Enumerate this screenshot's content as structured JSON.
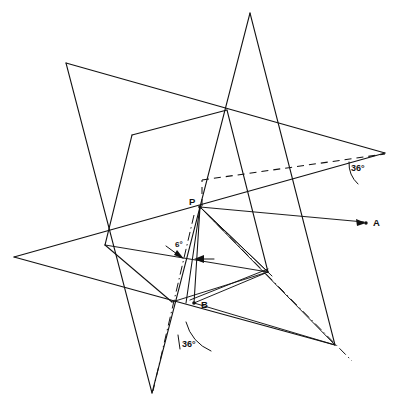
{
  "figure": {
    "width": 400,
    "height": 411,
    "background_color": "#ffffff",
    "line_color": "#111111"
  },
  "points": [
    {
      "id": "P",
      "label": "P",
      "x": 200,
      "y": 207,
      "label_x": 189,
      "label_y": 205
    },
    {
      "id": "A",
      "label": "A",
      "x": 366,
      "y": 223,
      "label_x": 373,
      "label_y": 226
    },
    {
      "id": "B",
      "label": "B",
      "x": 194,
      "y": 303,
      "label_x": 201,
      "label_y": 308
    }
  ],
  "angles": [
    {
      "id": "angle-right",
      "label": "36°",
      "value": 36,
      "unit": "degrees",
      "label_x": 351,
      "label_y": 171
    },
    {
      "id": "angle-bottom",
      "label": "36°",
      "value": 36,
      "unit": "degrees",
      "label_x": 180,
      "label_y": 345
    },
    {
      "id": "angle-wedge",
      "label": "6°",
      "value": 6,
      "unit": "degrees",
      "label_x": 175,
      "label_y": 247
    }
  ],
  "star": {
    "name": "outer-pentagram",
    "tips": [
      {
        "name": "tip-top",
        "x": 250,
        "y": 13
      },
      {
        "name": "tip-right",
        "x": 385,
        "y": 153
      },
      {
        "name": "tip-bottom-right",
        "x": 335,
        "y": 345
      },
      {
        "name": "tip-bottom-left",
        "x": 152,
        "y": 393
      },
      {
        "name": "tip-left",
        "x": 14,
        "y": 257
      },
      {
        "name": "tip-upper-left",
        "x": 66,
        "y": 63
      }
    ]
  },
  "legend": {
    "line_styles": [
      {
        "name": "solid",
        "meaning": "construction line"
      },
      {
        "name": "dashed",
        "meaning": "reference line"
      },
      {
        "name": "dash-dot",
        "meaning": "axis / centre line"
      }
    ]
  }
}
